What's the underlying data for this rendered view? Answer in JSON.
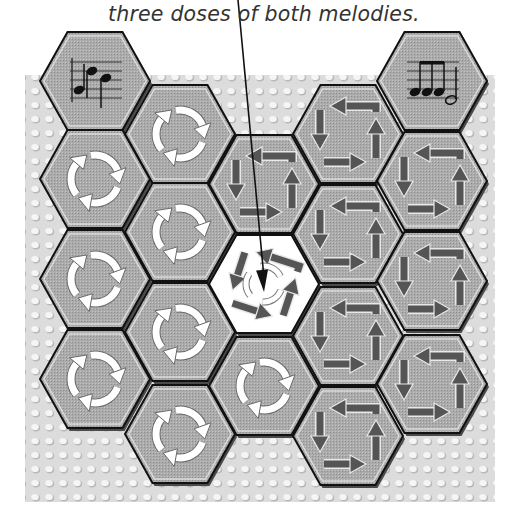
{
  "caption": {
    "text": "three doses of both melodies."
  },
  "colors": {
    "hex_fill": "#a9a9a9",
    "hex_fill_highlight": "#ffffff",
    "hex_outline": "#111111",
    "bevel_light": "#e6e6e6",
    "bevel_dark": "#4a4a4a",
    "background": "#dcdcdc",
    "bump": "#f4f4f4",
    "bump_shadow": "#b8b8b8",
    "arrow_white": "#ffffff",
    "arrow_dark": "#555555",
    "pointer_line": "#111111"
  },
  "board": {
    "x": 25,
    "y": 75,
    "width": 470,
    "height": 427
  },
  "hex_size": {
    "width": 110,
    "height": 98
  },
  "tiles": [
    {
      "id": "c1r0",
      "col": 1,
      "left": 40,
      "top": 32,
      "icon": "music-notes-icon",
      "variant": "melody-a"
    },
    {
      "id": "c1r1",
      "col": 1,
      "left": 40,
      "top": 130,
      "icon": "cycle-arrows-white-icon"
    },
    {
      "id": "c1r2",
      "col": 1,
      "left": 40,
      "top": 230,
      "icon": "cycle-arrows-white-icon"
    },
    {
      "id": "c1r3",
      "col": 1,
      "left": 40,
      "top": 330,
      "icon": "cycle-arrows-white-icon"
    },
    {
      "id": "c2r0",
      "col": 2,
      "left": 125,
      "top": 85,
      "icon": "cycle-arrows-white-icon"
    },
    {
      "id": "c2r1",
      "col": 2,
      "left": 125,
      "top": 183,
      "icon": "cycle-arrows-white-icon"
    },
    {
      "id": "c2r2",
      "col": 2,
      "left": 125,
      "top": 283,
      "icon": "cycle-arrows-white-icon"
    },
    {
      "id": "c2r3",
      "col": 2,
      "left": 125,
      "top": 385,
      "icon": "cycle-arrows-white-icon"
    },
    {
      "id": "c3r0",
      "col": 3,
      "left": 209,
      "top": 135,
      "icon": "square-arrows-dark-icon"
    },
    {
      "id": "c3r1",
      "col": 3,
      "left": 209,
      "top": 235,
      "icon": "mixed-arrows-icon",
      "highlight": true
    },
    {
      "id": "c3r2",
      "col": 3,
      "left": 209,
      "top": 337,
      "icon": "cycle-arrows-white-icon"
    },
    {
      "id": "c4r0",
      "col": 4,
      "left": 293,
      "top": 85,
      "icon": "square-arrows-dark-icon"
    },
    {
      "id": "c4r1",
      "col": 4,
      "left": 293,
      "top": 185,
      "icon": "square-arrows-dark-icon"
    },
    {
      "id": "c4r2",
      "col": 4,
      "left": 293,
      "top": 287,
      "icon": "square-arrows-dark-icon"
    },
    {
      "id": "c4r3",
      "col": 4,
      "left": 293,
      "top": 387,
      "icon": "square-arrows-dark-icon"
    },
    {
      "id": "c5r0",
      "col": 5,
      "left": 377,
      "top": 32,
      "icon": "music-notes-icon",
      "variant": "melody-b"
    },
    {
      "id": "c5r1",
      "col": 5,
      "left": 377,
      "top": 132,
      "icon": "square-arrows-dark-icon"
    },
    {
      "id": "c5r2",
      "col": 5,
      "left": 377,
      "top": 232,
      "icon": "square-arrows-dark-icon"
    },
    {
      "id": "c5r3",
      "col": 5,
      "left": 377,
      "top": 335,
      "icon": "square-arrows-dark-icon"
    }
  ],
  "pointer": {
    "x1": 238,
    "y1": 0,
    "x2": 264,
    "y2": 292
  }
}
